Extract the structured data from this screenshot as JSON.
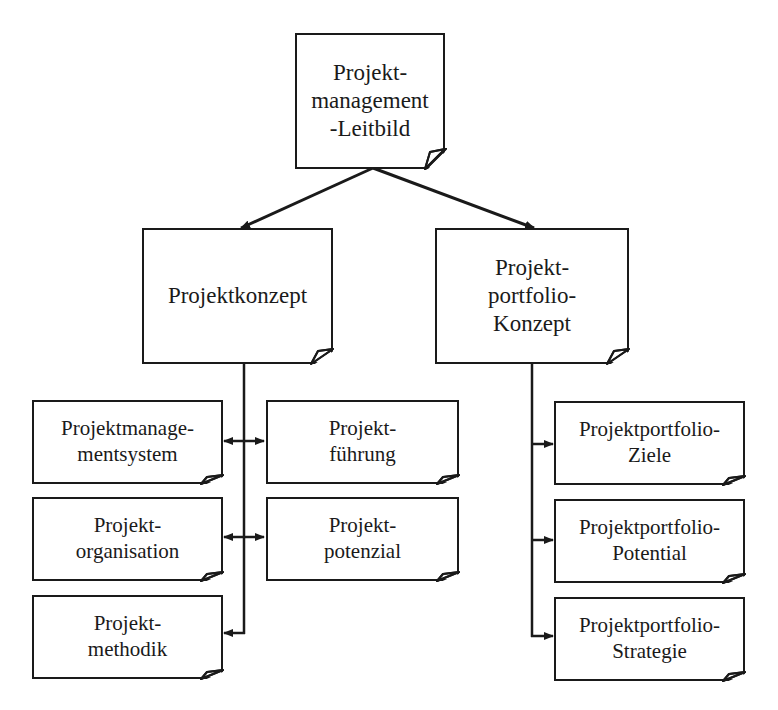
{
  "diagram": {
    "root": {
      "id": "leitbild",
      "lines": [
        "Projekt-",
        "management",
        "-Leitbild"
      ]
    },
    "level2": [
      {
        "id": "projektkonzept",
        "lines": [
          "Projektkonzept"
        ]
      },
      {
        "id": "portfolio-konzept",
        "lines": [
          "Projekt-",
          "portfolio-",
          "Konzept"
        ]
      }
    ],
    "projektkonzept_children": [
      {
        "id": "pm-system",
        "lines": [
          "Projektmanage-",
          "mentsystem"
        ]
      },
      {
        "id": "fuehrung",
        "lines": [
          "Projekt-",
          "führung"
        ]
      },
      {
        "id": "organisation",
        "lines": [
          "Projekt-",
          "organisation"
        ]
      },
      {
        "id": "potenzial",
        "lines": [
          "Projekt-",
          "potenzial"
        ]
      },
      {
        "id": "methodik",
        "lines": [
          "Projekt-",
          "methodik"
        ]
      }
    ],
    "portfolio_children": [
      {
        "id": "pp-ziele",
        "lines": [
          "Projektportfolio-",
          "Ziele"
        ]
      },
      {
        "id": "pp-potential",
        "lines": [
          "Projektportfolio-",
          "Potential"
        ]
      },
      {
        "id": "pp-strategie",
        "lines": [
          "Projektportfolio-",
          "Strategie"
        ]
      }
    ],
    "edges": [
      {
        "from": "leitbild",
        "to": "projektkonzept",
        "type": "arrow"
      },
      {
        "from": "leitbild",
        "to": "portfolio-konzept",
        "type": "arrow"
      },
      {
        "from": "projektkonzept",
        "to": "pm-system",
        "type": "arrow"
      },
      {
        "from": "projektkonzept",
        "to": "fuehrung",
        "type": "arrow"
      },
      {
        "from": "projektkonzept",
        "to": "organisation",
        "type": "arrow"
      },
      {
        "from": "projektkonzept",
        "to": "potenzial",
        "type": "arrow"
      },
      {
        "from": "projektkonzept",
        "to": "methodik",
        "type": "arrow"
      },
      {
        "from": "portfolio-konzept",
        "to": "pp-ziele",
        "type": "arrow"
      },
      {
        "from": "portfolio-konzept",
        "to": "pp-potential",
        "type": "arrow"
      },
      {
        "from": "portfolio-konzept",
        "to": "pp-strategie",
        "type": "arrow"
      }
    ],
    "colors": {
      "stroke": "#1a1a1a",
      "fill": "#ffffff",
      "background": "#ffffff"
    }
  }
}
